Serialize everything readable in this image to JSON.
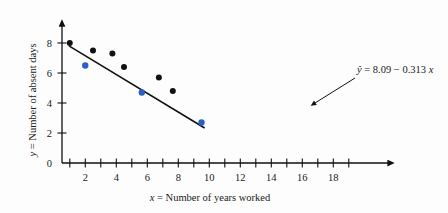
{
  "figure": {
    "background_color": "#fdfdfd",
    "point_color_primary": "#111111",
    "point_color_secondary": "#2b5fc4",
    "line_color": "#111111"
  },
  "annotation": {
    "equation_yhat": "ŷ",
    "equation_rest": " = 8.09 − 0.313 ",
    "equation_x": "x",
    "equation_full": "ŷ = 8.09 − 0.313 x",
    "intercept": 8.09,
    "slope": -0.313
  },
  "axes": {
    "x_title_var": "x",
    "x_title_rest": " = Number of years worked",
    "y_title_var": "y",
    "y_title_rest": " = Number of absent days",
    "x_ticks_labeled": [
      "2",
      "4",
      "6",
      "8",
      "10",
      "12",
      "14",
      "16",
      "18"
    ],
    "x_tick_values": [
      2,
      4,
      6,
      8,
      10,
      12,
      14,
      16,
      18
    ],
    "x_minor_tick_values": [
      1,
      3,
      5,
      7,
      9,
      11,
      13,
      15,
      17,
      19
    ],
    "y_ticks_labeled": [
      "0",
      "2",
      "4",
      "6",
      "8"
    ],
    "y_tick_values": [
      0,
      2,
      4,
      6,
      8
    ],
    "x_range": [
      0,
      20
    ],
    "y_range": [
      0,
      9.2
    ],
    "grid": "off"
  },
  "chart_data": {
    "type": "scatter",
    "title": "",
    "xlabel": "x = Number of years worked",
    "ylabel": "y = Number of absent days",
    "xlim": [
      0,
      20
    ],
    "ylim": [
      0,
      9.2
    ],
    "grid": false,
    "legend": "none",
    "annotations": [
      {
        "text": "ŷ = 8.09 − 0.313 x",
        "x": 16.5,
        "y": 6.6,
        "pointer_to_x": 13.0,
        "pointer_to_y": 4.2
      }
    ],
    "series": [
      {
        "name": "data points (black)",
        "color": "#111111",
        "marker": "circle",
        "points": [
          {
            "x": 1.0,
            "y": 8.0
          },
          {
            "x": 4.0,
            "y": 7.5
          },
          {
            "x": 6.5,
            "y": 7.3
          },
          {
            "x": 8.0,
            "y": 6.4
          },
          {
            "x": 12.5,
            "y": 5.7
          },
          {
            "x": 14.3,
            "y": 4.8
          }
        ]
      },
      {
        "name": "data points (blue)",
        "color": "#2b5fc4",
        "marker": "circle",
        "points": [
          {
            "x": 3.0,
            "y": 6.5
          },
          {
            "x": 10.3,
            "y": 4.7
          },
          {
            "x": 18.0,
            "y": 2.7
          }
        ]
      }
    ],
    "fit_line": {
      "name": "least squares regression line",
      "type": "line",
      "color": "#111111",
      "equation": "ŷ = 8.09 − 0.313 x",
      "intercept": 8.09,
      "slope": -0.313,
      "x_start": 0.9,
      "x_end": 18.4
    }
  }
}
